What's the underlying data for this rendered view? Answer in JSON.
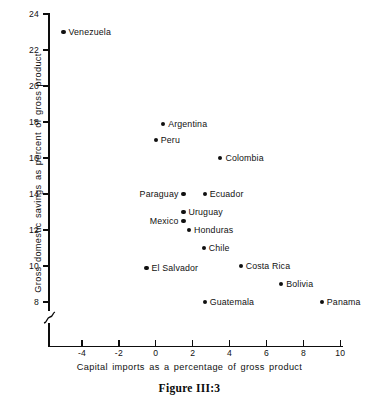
{
  "figure": {
    "caption": "Figure III:3"
  },
  "chart_data": {
    "type": "scatter",
    "title": "",
    "xlabel": "Capital imports as a percentage of gross product",
    "ylabel": "Gross domestic savings as percent of gross product",
    "xlim": [
      -5.8,
      10.2
    ],
    "ylim": [
      7.2,
      24
    ],
    "xticks": [
      -4,
      -2,
      0,
      2,
      4,
      6,
      8,
      10
    ],
    "xtick_labels": [
      "-4",
      "-2",
      "0",
      "2",
      "4",
      "6",
      "8",
      "10"
    ],
    "yticks": [
      8,
      10,
      12,
      14,
      16,
      18,
      20,
      22,
      24
    ],
    "ytick_labels": [
      "8",
      "10",
      "12",
      "14",
      "16",
      "18",
      "20",
      "22",
      "24"
    ],
    "grid": false,
    "legend": "none",
    "y_axis_break": true,
    "marker_color": "#101010",
    "points": [
      {
        "label": "Venezuela",
        "x": -5.0,
        "y": 23.0,
        "label_side": "right"
      },
      {
        "label": "Argentina",
        "x": 0.4,
        "y": 17.9,
        "label_side": "right"
      },
      {
        "label": "Peru",
        "x": 0.0,
        "y": 17.0,
        "label_side": "right"
      },
      {
        "label": "Colombia",
        "x": 3.5,
        "y": 16.0,
        "label_side": "right"
      },
      {
        "label": "Paraguay",
        "x": 1.5,
        "y": 14.0,
        "label_side": "left"
      },
      {
        "label": "Ecuador",
        "x": 2.65,
        "y": 14.0,
        "label_side": "right"
      },
      {
        "label": "Uruguay",
        "x": 1.5,
        "y": 13.0,
        "label_side": "right"
      },
      {
        "label": "Mexico",
        "x": 1.5,
        "y": 12.5,
        "label_side": "left"
      },
      {
        "label": "Honduras",
        "x": 1.8,
        "y": 12.0,
        "label_side": "right"
      },
      {
        "label": "Chile",
        "x": 2.6,
        "y": 11.0,
        "label_side": "right"
      },
      {
        "label": "El Salvador",
        "x": -0.5,
        "y": 9.9,
        "label_side": "right"
      },
      {
        "label": "Costa Rica",
        "x": 4.6,
        "y": 10.0,
        "label_side": "right"
      },
      {
        "label": "Bolivia",
        "x": 6.8,
        "y": 9.0,
        "label_side": "right"
      },
      {
        "label": "Guatemala",
        "x": 2.65,
        "y": 8.0,
        "label_side": "right"
      },
      {
        "label": "Panama",
        "x": 9.0,
        "y": 8.0,
        "label_side": "right"
      }
    ]
  }
}
